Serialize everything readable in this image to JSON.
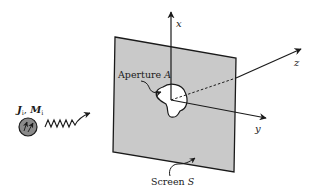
{
  "diagram": {
    "labels": {
      "x_axis": "x",
      "y_axis": "y",
      "z_axis": "z",
      "aperture_prefix": "Aperture ",
      "aperture_symbol": "A",
      "screen_prefix": "Screen ",
      "screen_symbol": "S",
      "source_J": "J",
      "source_J_sub": "i",
      "source_sep": ", ",
      "source_M": "M",
      "source_M_sub": "i"
    },
    "colors": {
      "screen_fill": "#c9c9c9",
      "stroke": "#1a1a1a",
      "background": "#ffffff",
      "source_fill": "#8a8a8a"
    }
  }
}
